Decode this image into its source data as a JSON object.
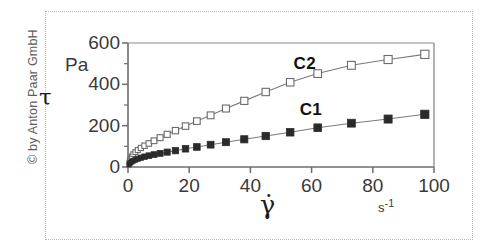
{
  "copyright": {
    "text": "© by Anton Paar GmbH"
  },
  "axes": {
    "y_unit": "Pa",
    "y_symbol": "τ",
    "x_unit": "s-1",
    "x_unit_base": "s",
    "x_unit_exp": "-1",
    "x_symbol": "γ̇",
    "y_ticks": [
      "600",
      "400",
      "200",
      "0"
    ],
    "x_ticks": [
      "0",
      "20",
      "40",
      "60",
      "80",
      "100"
    ]
  },
  "series_labels": {
    "c2": "C2",
    "c1": "C1"
  },
  "colors": {
    "axis": "#6e6e6e",
    "frame": "#8a8a8a",
    "curve": "#7a7a7a",
    "marker_open_fill": "#ffffff",
    "marker_open_stroke": "#6b6b6b",
    "marker_filled": "#2b2b2b",
    "page_border": "#bdbdbd",
    "text": "#3a3a3a"
  },
  "chart_data": {
    "type": "line",
    "title": "",
    "xlabel": "γ̇",
    "ylabel": "τ",
    "xunit": "s^-1",
    "yunit": "Pa",
    "xlim": [
      0,
      100
    ],
    "ylim": [
      0,
      600
    ],
    "x_ticks": [
      0,
      20,
      40,
      60,
      80,
      100
    ],
    "y_ticks": [
      0,
      100,
      200,
      300,
      400,
      500,
      600
    ],
    "y_labeled_ticks": [
      0,
      200,
      400,
      600
    ],
    "grid": false,
    "legend": "inline-annotations",
    "series": [
      {
        "name": "C2",
        "marker": "open-square",
        "label_x": 60,
        "label_y": 500,
        "points": [
          [
            0.3,
            22
          ],
          [
            0.5,
            32
          ],
          [
            0.8,
            42
          ],
          [
            1.2,
            52
          ],
          [
            1.7,
            62
          ],
          [
            2.4,
            72
          ],
          [
            3.2,
            82
          ],
          [
            4.2,
            92
          ],
          [
            5.4,
            103
          ],
          [
            6.8,
            114
          ],
          [
            8.5,
            127
          ],
          [
            10.5,
            142
          ],
          [
            12.8,
            158
          ],
          [
            15.5,
            176
          ],
          [
            18.8,
            198
          ],
          [
            22.5,
            222
          ],
          [
            27,
            250
          ],
          [
            32,
            283
          ],
          [
            38,
            320
          ],
          [
            45,
            363
          ],
          [
            53,
            410
          ],
          [
            62,
            452
          ],
          [
            73,
            492
          ],
          [
            85,
            520
          ],
          [
            97,
            545
          ]
        ]
      },
      {
        "name": "C1",
        "marker": "filled-square",
        "label_x": 62,
        "label_y": 275,
        "points": [
          [
            0.3,
            10
          ],
          [
            0.5,
            15
          ],
          [
            0.8,
            20
          ],
          [
            1.2,
            25
          ],
          [
            1.7,
            30
          ],
          [
            2.4,
            35
          ],
          [
            3.2,
            40
          ],
          [
            4.2,
            45
          ],
          [
            5.4,
            50
          ],
          [
            6.8,
            55
          ],
          [
            8.5,
            60
          ],
          [
            10.5,
            66
          ],
          [
            12.8,
            72
          ],
          [
            15.5,
            79
          ],
          [
            18.8,
            88
          ],
          [
            22.5,
            97
          ],
          [
            27,
            108
          ],
          [
            32,
            120
          ],
          [
            38,
            134
          ],
          [
            45,
            150
          ],
          [
            53,
            168
          ],
          [
            62,
            190
          ],
          [
            73,
            212
          ],
          [
            85,
            232
          ],
          [
            97,
            255
          ]
        ]
      }
    ]
  }
}
